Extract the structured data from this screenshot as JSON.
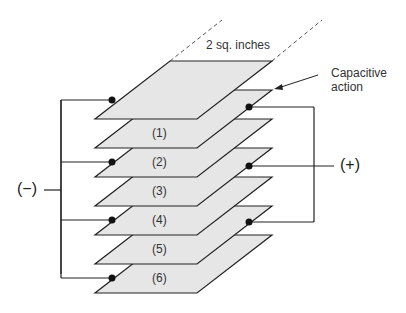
{
  "title_label": "2 sq. inches",
  "annotation": {
    "line1": "Capacitive",
    "line2": "action"
  },
  "negative_terminal": "(−)",
  "positive_terminal": "(+)",
  "plates": [
    {
      "label": ""
    },
    {
      "label": "(1)"
    },
    {
      "label": "(2)"
    },
    {
      "label": "(3)"
    },
    {
      "label": "(4)"
    },
    {
      "label": "(5)"
    },
    {
      "label": "(6)"
    }
  ],
  "colors": {
    "plate_fill": "#e6e6e6",
    "line": "#222222"
  }
}
